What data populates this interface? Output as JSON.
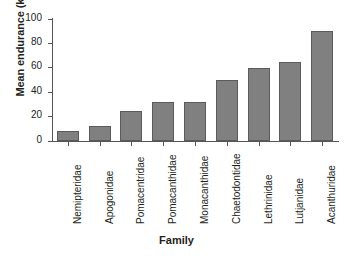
{
  "chart_data": {
    "type": "bar",
    "title": "",
    "subtitle": "",
    "xlabel": "Family",
    "ylabel": "Mean endurance (km)",
    "categories": [
      "Nemipteridae",
      "Apogonidae",
      "Pomacentridae",
      "Pomacanthidae",
      "Monacanthidae",
      "Chaetodontidae",
      "Lethrinidae",
      "Lutjanidae",
      "Acanthuridae"
    ],
    "values": [
      8,
      12,
      25,
      32,
      32,
      50,
      60,
      65,
      90
    ],
    "ylim": [
      0,
      100
    ],
    "yticks": [
      "0",
      "20",
      "40",
      "60",
      "80",
      "100"
    ],
    "ytick_values": [
      0,
      20,
      40,
      60,
      80,
      100
    ],
    "grid": false,
    "legend": false,
    "legend_position": "none",
    "bar_color": "#808080",
    "bar_edge_color": "#5b5b5b",
    "axis_color": "#555555",
    "background_color": "#ffffff"
  }
}
